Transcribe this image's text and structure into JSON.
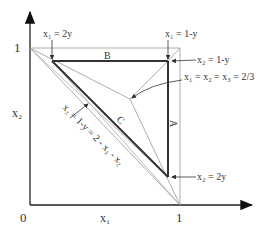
{
  "axes": {
    "origin_label": "0",
    "x_tick_label": "1",
    "y_tick_label": "1",
    "x_axis_label": "x₁",
    "y_axis_label": "x₂"
  },
  "regions": {
    "B": "B",
    "A": "A",
    "C": "C"
  },
  "annotations": {
    "top_left": "x₁ = 2y",
    "top_right": "x₁ = 1-y",
    "right_upper": "x₂ = 1-y",
    "centroid": "x₁ = x₂ = x₃ = 2/3",
    "right_lower": "x₂ = 2y",
    "diagonal": "x₃ = 1-y = 2 - x₁ - x₂"
  },
  "colors": {
    "axis": "#222222",
    "thick": "#333333",
    "thin": "#999999"
  }
}
